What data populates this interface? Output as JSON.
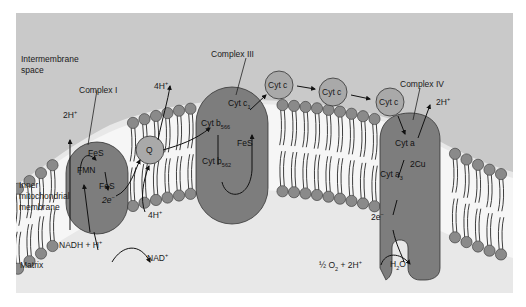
{
  "diagram": {
    "colors": {
      "intermembrane_bg": "#c9c9c9",
      "matrix_bg": "#e8e8e8",
      "protein": "#7d7d7d",
      "small_carrier": "#a9a9a9",
      "lipid_head": "#8a8a8a",
      "membrane_core": "#f4f4f4"
    },
    "regions": {
      "intermembrane": "Intermembrane",
      "intermembrane2": "space",
      "inner1": "Inner",
      "inner2": "mitochondrial",
      "inner3": "membrane",
      "matrix": "Matrix"
    },
    "complexes": {
      "c1": {
        "label": "Complex I",
        "fes1": "FeS",
        "fmn": "FMN",
        "fes2": "FeS",
        "e": "2e",
        "e_sup": "−",
        "proton_out": "2H",
        "proton_out_sup": "+"
      },
      "q": {
        "label": "Q",
        "proton_in": "4H",
        "proton_in_sup": "+",
        "proton_out": "4H",
        "proton_out_sup": "+"
      },
      "c3": {
        "label": "Complex III",
        "cytc1": "Cyt c",
        "cytc1_sub": "1",
        "b566": "Cyt b",
        "b566_sub": "566",
        "b562": "Cyt b",
        "b562_sub": "562",
        "fes": "FeS"
      },
      "cytc": {
        "labels": [
          "Cyt c",
          "Cyt c",
          "Cyt c"
        ]
      },
      "c4": {
        "label": "Complex IV",
        "cyta": "Cyt a",
        "cu": "2Cu",
        "cyta3": "Cyt a",
        "cyta3_sub": "3",
        "e": "2e",
        "e_sup": "−",
        "proton_out": "2H",
        "proton_out_sup": "+"
      }
    },
    "reactions": {
      "nadh": "NADH + H",
      "nadh_sup": "+",
      "nad": "NAD",
      "nad_sup": "+",
      "o2_a": "½ O",
      "o2_sub": "2",
      "o2_b": " + 2H",
      "o2_sup": "+",
      "h2o_a": "H",
      "h2o_sub": "2",
      "h2o_b": "O"
    }
  }
}
